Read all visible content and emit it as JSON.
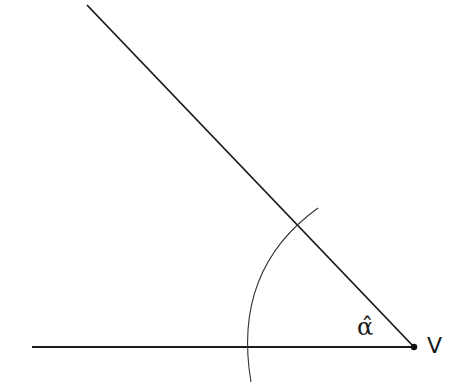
{
  "diagram": {
    "angle_label": "α̂",
    "vertex_label": "V",
    "vertex": {
      "x": 414,
      "y": 347
    },
    "rays": [
      {
        "name": "horizontal-ray",
        "from": {
          "x": 32,
          "y": 347
        },
        "to": {
          "x": 414,
          "y": 347
        }
      },
      {
        "name": "slanted-ray",
        "from": {
          "x": 87,
          "y": 5
        },
        "to": {
          "x": 414,
          "y": 347
        }
      }
    ],
    "arc": {
      "center": {
        "x": 414,
        "y": 347
      },
      "start": {
        "x": 318,
        "y": 208
      },
      "end": {
        "x": 251,
        "y": 382
      }
    },
    "colors": {
      "line": "#1a1a1a",
      "arc": "#333333",
      "background": "#ffffff"
    }
  }
}
